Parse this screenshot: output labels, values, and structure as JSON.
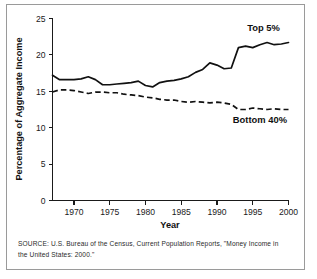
{
  "figure": {
    "source_note": "SOURCE: U.S. Bureau of the Census, Current Population Reports, \"Money Income in the United States: 2000.\""
  },
  "chart_data": {
    "type": "line",
    "title": "",
    "xlabel": "Year",
    "ylabel": "Percentage of Aggregate Income",
    "xlim": [
      1967,
      2000
    ],
    "ylim": [
      0,
      25
    ],
    "xticks": [
      1970,
      1975,
      1980,
      1985,
      1990,
      1995,
      2000
    ],
    "yticks": [
      0,
      5,
      10,
      15,
      20,
      25
    ],
    "xtick_labels": [
      "1970",
      "1975",
      "1980",
      "1985",
      "1990",
      "1995",
      "2000"
    ],
    "ytick_labels": [
      "0",
      "5",
      "10",
      "15",
      "20",
      "25"
    ],
    "grid": false,
    "legend_position": "inline-annotations",
    "x": [
      1967,
      1968,
      1969,
      1970,
      1971,
      1972,
      1973,
      1974,
      1975,
      1976,
      1977,
      1978,
      1979,
      1980,
      1981,
      1982,
      1983,
      1984,
      1985,
      1986,
      1987,
      1988,
      1989,
      1990,
      1991,
      1992,
      1993,
      1994,
      1995,
      1996,
      1997,
      1998,
      1999,
      2000
    ],
    "series": [
      {
        "name": "Top 5%",
        "style": "solid",
        "color": "#111111",
        "label_text": "Top 5%",
        "values": [
          17.2,
          16.6,
          16.6,
          16.6,
          16.7,
          17.0,
          16.6,
          15.9,
          15.9,
          16.0,
          16.1,
          16.2,
          16.4,
          15.8,
          15.6,
          16.2,
          16.4,
          16.5,
          16.7,
          17.0,
          17.6,
          18.0,
          18.9,
          18.6,
          18.1,
          18.2,
          21.0,
          21.2,
          21.0,
          21.4,
          21.7,
          21.4,
          21.5,
          21.7
        ]
      },
      {
        "name": "Bottom 40%",
        "style": "dashed",
        "color": "#111111",
        "label_text": "Bottom 40%",
        "values": [
          14.9,
          15.2,
          15.2,
          15.1,
          14.9,
          14.7,
          14.9,
          14.9,
          14.8,
          14.8,
          14.6,
          14.5,
          14.4,
          14.2,
          14.1,
          13.9,
          13.8,
          13.8,
          13.6,
          13.5,
          13.6,
          13.5,
          13.4,
          13.5,
          13.4,
          13.2,
          12.5,
          12.5,
          12.7,
          12.6,
          12.5,
          12.6,
          12.5,
          12.5
        ]
      }
    ],
    "annotations": [
      {
        "text": "Top 5%",
        "x": 1996.5,
        "y": 23.3
      },
      {
        "text": "Bottom 40%",
        "x": 1996.0,
        "y": 10.6
      }
    ]
  }
}
